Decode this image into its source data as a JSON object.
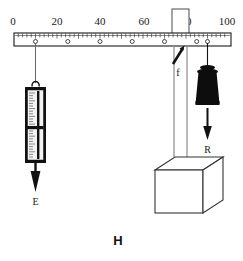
{
  "figure": {
    "label": "H",
    "type": "physics-lever-diagram",
    "background_color": "#ffffff",
    "ink_color": "#1a1a1a"
  },
  "ruler": {
    "name": "measuring-ruler-beam",
    "x_start": 14,
    "x_end": 231,
    "y_top": 33,
    "y_bottom": 46,
    "scale_min": 0,
    "scale_max": 100,
    "major_labels": [
      "0",
      "20",
      "40",
      "60",
      "80",
      "100"
    ],
    "major_label_values": [
      0,
      20,
      40,
      60,
      80,
      100
    ],
    "minor_tick_step": 2,
    "hole_positions": [
      10,
      25,
      40,
      55,
      70,
      85,
      90
    ],
    "hole_marker": "small-circle"
  },
  "spring_scale": {
    "name": "spring-scale-dynamometer",
    "attached_at_value": 10,
    "body_color": "#111111",
    "face_color": "#f2f2f2",
    "pointer_color": "#111111",
    "has_hook": true,
    "graduations": 26
  },
  "forces": [
    {
      "id": "E",
      "label": "E",
      "name": "force-arrow-E",
      "direction": "down",
      "description": "effort force arrow pointing downward below spring scale"
    },
    {
      "id": "f",
      "label": "f",
      "name": "force-arrow-f",
      "direction": "up-right-diagonal",
      "description": "fulcrum reaction force arrow at post, pointing up and right"
    },
    {
      "id": "R",
      "label": "R",
      "name": "force-arrow-R",
      "direction": "down",
      "description": "resistance load arrow pointing downward below weight"
    }
  ],
  "weight": {
    "name": "hanging-weight-mass",
    "attached_at_value": 90,
    "color": "#0d0d0d",
    "shape": "lab-weight-with-knob"
  },
  "support_post": {
    "name": "vertical-support-post",
    "at_value": 80,
    "color": "#555555",
    "description": "vertical post passing through the ruler acting as fulcrum"
  },
  "weight_line": {
    "name": "weight-suspension-line",
    "at_value": 90,
    "color": "#111111"
  },
  "base_box": {
    "name": "support-base-box",
    "shape": "3d-cube",
    "face_color": "#ffffff",
    "edge_color": "#333333"
  }
}
